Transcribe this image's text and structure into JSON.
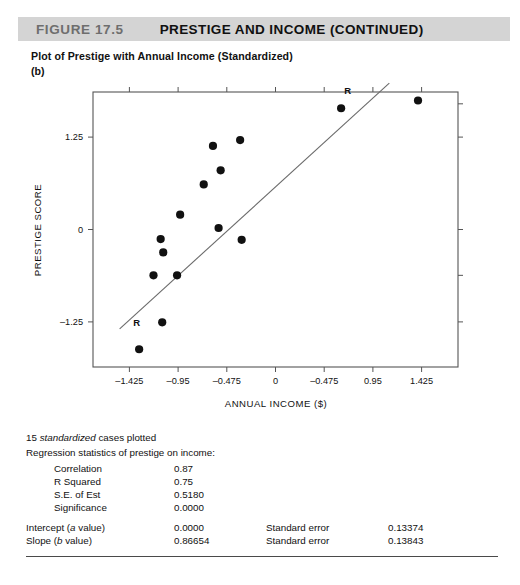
{
  "header": {
    "figure_number": "FIGURE 17.5",
    "title": "PRESTIGE AND INCOME (CONTINUED)",
    "band_color": "#d4d4d4",
    "number_color": "#6e6e6e"
  },
  "subtitle": "Plot of Prestige with Annual Income (Standardized)",
  "panel_letter": "(b)",
  "chart_data": {
    "type": "scatter",
    "title": "Plot of Prestige with Annual Income (Standardized)",
    "xlabel": "ANNUAL INCOME ($)",
    "ylabel": "PRESTIGE SCORE",
    "xlim": [
      -1.78,
      1.78
    ],
    "ylim": [
      -1.86,
      1.86
    ],
    "xticks": [
      -1.425,
      -0.95,
      -0.475,
      0,
      0.475,
      0.95,
      1.425
    ],
    "xticklabels": [
      "–1.425",
      "–0.95",
      "–0.475",
      "0",
      "–0.475",
      "0.95",
      "1.425"
    ],
    "yticks": [
      1.25,
      0,
      -1.25
    ],
    "yticklabels": [
      "1.25",
      "0",
      "–1.25"
    ],
    "grid": false,
    "legend": null,
    "marker_color": "#111111",
    "line_color": "#6a6a6a",
    "frame_color": "#555555",
    "n_points": 15,
    "points": [
      {
        "x": -1.33,
        "y": -1.62
      },
      {
        "x": -1.105,
        "y": -1.255
      },
      {
        "x": -1.19,
        "y": -0.62
      },
      {
        "x": -0.96,
        "y": -0.62
      },
      {
        "x": -1.095,
        "y": -0.31
      },
      {
        "x": -1.12,
        "y": -0.13
      },
      {
        "x": -0.93,
        "y": 0.2
      },
      {
        "x": -0.7,
        "y": 0.61
      },
      {
        "x": -0.61,
        "y": 1.13
      },
      {
        "x": -0.535,
        "y": 0.8
      },
      {
        "x": -0.555,
        "y": 0.02
      },
      {
        "x": -0.345,
        "y": 1.21
      },
      {
        "x": -0.33,
        "y": -0.14
      },
      {
        "x": 0.64,
        "y": 1.64
      },
      {
        "x": 1.39,
        "y": 1.745
      }
    ],
    "regression_line": {
      "label": "R",
      "endpoints": [
        {
          "x": -1.52,
          "y": -1.345
        },
        {
          "x": 1.11,
          "y": 1.98
        }
      ],
      "marker_points": [
        {
          "x": -1.355,
          "y": -1.255
        },
        {
          "x": 0.705,
          "y": 1.875
        }
      ]
    }
  },
  "stats": {
    "cases_line_pre": "15 ",
    "cases_line_italic": "standardized",
    "cases_line_post": " cases plotted",
    "heading": "Regression statistics of prestige on income:",
    "rows": [
      {
        "label": "Correlation",
        "value": "0.87"
      },
      {
        "label": "R Squared",
        "value": "0.75"
      },
      {
        "label": "S.E. of Est",
        "value": "0.5180"
      },
      {
        "label": "Significance",
        "value": "0.0000"
      }
    ],
    "coef_rows": [
      {
        "label_pre": "Intercept (",
        "label_italic": "a",
        "label_post": " value)",
        "value": "0.0000",
        "se_label": "Standard error",
        "se_value": "0.13374"
      },
      {
        "label_pre": "Slope (",
        "label_italic": "b",
        "label_post": " value)",
        "value": "0.86654",
        "se_label": "Standard error",
        "se_value": "0.13843"
      }
    ]
  }
}
